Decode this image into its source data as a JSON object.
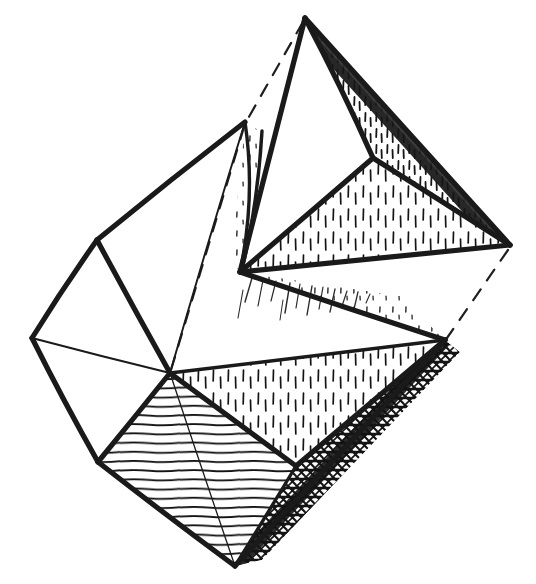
{
  "figure": {
    "kind": "line-illustration",
    "background_color": "#ffffff",
    "ink_color": "#1a1a1a",
    "canvas": {
      "width": 536,
      "height": 584
    },
    "caption": "",
    "labels": [],
    "annotations": []
  },
  "geometry": {
    "description": "Two interpenetrating octahedra drawn in ink with hatched and stippled shading.",
    "vertices": {
      "top_apex": {
        "x": 305,
        "y": 18,
        "name": "top-apex"
      },
      "right_apex": {
        "x": 510,
        "y": 245,
        "name": "right-apex"
      },
      "mid_ridge": {
        "x": 373,
        "y": 158,
        "name": "mid-ridge-vertex"
      },
      "second_peak": {
        "x": 245,
        "y": 122,
        "name": "second-peak"
      },
      "front_left": {
        "x": 240,
        "y": 272,
        "name": "front-left-vertex"
      },
      "upper_left": {
        "x": 97,
        "y": 240,
        "name": "upper-left-vertex"
      },
      "far_left": {
        "x": 32,
        "y": 338,
        "name": "far-left-vertex"
      },
      "center": {
        "x": 170,
        "y": 373,
        "name": "center-vertex"
      },
      "lower_left": {
        "x": 98,
        "y": 462,
        "name": "lower-left-vertex"
      },
      "right_mid": {
        "x": 445,
        "y": 340,
        "name": "right-mid-vertex"
      },
      "bottom_apex": {
        "x": 235,
        "y": 566,
        "name": "bottom-apex"
      },
      "lower_right_mid": {
        "x": 296,
        "y": 466,
        "name": "lower-right-mid-vertex"
      }
    },
    "faces": [
      {
        "name": "upper-right-dark-face",
        "shading": "dense-stipple-dark",
        "points": "305,18 373,158 510,245"
      },
      {
        "name": "upper-left-bright-face",
        "shading": "none",
        "points": "305,18 373,158 240,272"
      },
      {
        "name": "large-stippled-face",
        "shading": "vertical-stipple",
        "points": "373,158 510,245 240,272"
      },
      {
        "name": "narrow-peak-face",
        "shading": "fine-stipple",
        "points": "245,122 262,130 238,272"
      },
      {
        "name": "upper-left-plain-face",
        "shading": "none",
        "points": "245,122 97,240 170,373"
      },
      {
        "name": "left-plain-face",
        "shading": "none",
        "points": "97,240 32,338 170,373"
      },
      {
        "name": "lower-left-plain-face",
        "shading": "none",
        "points": "32,338 98,462 170,373"
      },
      {
        "name": "horizontal-hatched-rhombus",
        "shading": "horizontal-hatch",
        "points": "170,373 98,462 235,566 296,466"
      },
      {
        "name": "middle-stippled-face",
        "shading": "vertical-stipple",
        "points": "170,373 445,340 296,466"
      },
      {
        "name": "dark-crosshatch-sliver",
        "shading": "dense-crosshatch-dark",
        "points": "445,340 296,466 235,566 258,556"
      },
      {
        "name": "right-strip-face",
        "shading": "light-stipple-edge",
        "points": "240,272 445,340 373,300"
      }
    ],
    "hidden_edges": [
      {
        "name": "hidden-edge-apex-to-peak",
        "from": "top_apex",
        "to": "second_peak"
      },
      {
        "name": "hidden-edge-peak-to-center",
        "from": "second_peak",
        "to": "center"
      },
      {
        "name": "hidden-edge-right-apex-to-right-mid",
        "from": "right_apex",
        "to": "right_mid"
      }
    ]
  },
  "shading_legend": {
    "horizontal_hatch": "closely spaced horizontal ruled lines",
    "vertical_stipple": "short vertical tick marks",
    "dark_stipple": "dense short ticks on dark ground",
    "crosshatch": "overlapping diagonal strokes, near solid black"
  }
}
